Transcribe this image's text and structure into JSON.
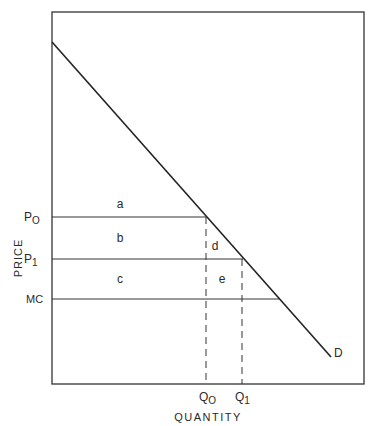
{
  "diagram": {
    "axis_labels": {
      "y": "PRICE",
      "x": "QUANTITY"
    },
    "price_labels": {
      "p0": {
        "base": "P",
        "sub": "O"
      },
      "p1": {
        "base": "P",
        "sub": "1"
      },
      "mc": "MC"
    },
    "quantity_labels": {
      "q0": {
        "base": "Q",
        "sub": "O"
      },
      "q1": {
        "base": "Q",
        "sub": "1"
      }
    },
    "curve_label": "D",
    "region_labels": {
      "a": "a",
      "b": "b",
      "c": "c",
      "d": "d",
      "e": "e"
    },
    "colors": {
      "line": "#2a2a2a",
      "background": "#ffffff"
    }
  }
}
